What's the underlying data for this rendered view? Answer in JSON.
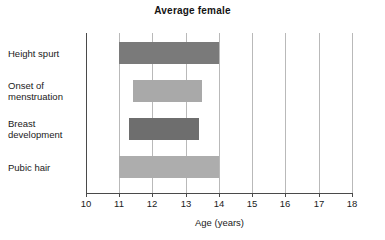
{
  "chart_data": {
    "type": "bar",
    "orientation": "horizontal",
    "title": "Average female",
    "xlabel": "Age (years)",
    "ylabel": "",
    "xlim": [
      10,
      18
    ],
    "xticks": [
      10,
      11,
      12,
      13,
      14,
      15,
      16,
      17,
      18
    ],
    "xtick_labels": [
      "10",
      "11",
      "12",
      "13",
      "14",
      "15",
      "16",
      "17",
      "18"
    ],
    "grid": true,
    "legend": "none",
    "categories": [
      "Height spurt",
      "Onset of menstruation",
      "Breast development",
      "Pubic hair"
    ],
    "bars": [
      {
        "label": "Height spurt",
        "label_lines": [
          "Height spurt"
        ],
        "start": 11.0,
        "end": 14.0,
        "color": "#7a7a7a"
      },
      {
        "label": "Onset of menstruation",
        "label_lines": [
          "Onset of",
          "menstruation"
        ],
        "start": 11.4,
        "end": 13.5,
        "color": "#a9a9a9"
      },
      {
        "label": "Breast development",
        "label_lines": [
          "Breast",
          "development"
        ],
        "start": 11.3,
        "end": 13.4,
        "color": "#6e6e6e"
      },
      {
        "label": "Pubic hair",
        "label_lines": [
          "Pubic hair"
        ],
        "start": 11.0,
        "end": 14.0,
        "color": "#adadad"
      }
    ]
  },
  "chart": {
    "title": "Average female",
    "x_axis_title": "Age (years)",
    "ticks": {
      "t0": "10",
      "t1": "11",
      "t2": "12",
      "t3": "13",
      "t4": "14",
      "t5": "15",
      "t6": "16",
      "t7": "17",
      "t8": "18"
    },
    "labels": {
      "height_spurt_l1": "Height spurt",
      "onset_l1": "Onset of",
      "onset_l2": "menstruation",
      "breast_l1": "Breast",
      "breast_l2": "development",
      "pubic_l1": "Pubic hair"
    }
  }
}
